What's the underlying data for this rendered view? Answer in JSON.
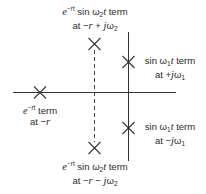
{
  "diagram": {
    "type": "s-plane pole plot",
    "colors": {
      "line": "#333333",
      "text": "#2a2a2a",
      "background": "#ffffff"
    },
    "axes": {
      "horizontal": "real axis",
      "vertical": "imaginary axis"
    },
    "poles": [
      {
        "id": "exp",
        "marker": "x-mark-icon",
        "line1": "term",
        "line1_prefix": "e",
        "line1_exp": "−rt",
        "line2_prefix": "at −",
        "line2_var": "r"
      },
      {
        "id": "damped-upper",
        "marker": "x-mark-icon",
        "line1_prefix": "e",
        "line1_exp": "−rt",
        "line1_mid": " sin ω",
        "line1_sub": "2",
        "line1_t": "t",
        "line1_suffix": " term",
        "line2": "at −r + jω2"
      },
      {
        "id": "damped-lower",
        "marker": "x-mark-icon",
        "line1_prefix": "e",
        "line1_exp": "−rt",
        "line1_mid": " sin ω",
        "line1_sub": "2",
        "line1_t": "t",
        "line1_suffix": " term",
        "line2": "at −r − jω2"
      },
      {
        "id": "sine-upper",
        "marker": "x-mark-icon",
        "line1": "sin ω1t term",
        "line2": "at +jω1"
      },
      {
        "id": "sine-lower",
        "marker": "x-mark-icon",
        "line1": "sin ω1t term",
        "line2": "at −jω1"
      }
    ],
    "labels": {
      "exp": {
        "l1_a": "e",
        "l1_sup": "−rt",
        "l1_b": " term",
        "l2_a": "at −",
        "l2_var": "r"
      },
      "upper_damped": {
        "l1_a": "e",
        "l1_sup": "−rt",
        "l1_b": " sin ω",
        "l1_sub": "2",
        "l1_t": "t",
        "l1_c": " term",
        "l2_a": "at −",
        "l2_r": "r",
        "l2_b": " + ",
        "l2_j": "j",
        "l2_w": "ω",
        "l2_sub": "2"
      },
      "lower_damped": {
        "l1_a": "e",
        "l1_sup": "−rt",
        "l1_b": " sin ω",
        "l1_sub": "2",
        "l1_t": "t",
        "l1_c": " term",
        "l2_a": "at −",
        "l2_r": "r",
        "l2_b": " − ",
        "l2_j": "j",
        "l2_w": "ω",
        "l2_sub": "2"
      },
      "upper_sine": {
        "l1_a": "sin ω",
        "l1_sub": "1",
        "l1_t": "t",
        "l1_c": " term",
        "l2_a": "at +",
        "l2_j": "j",
        "l2_w": "ω",
        "l2_sub": "1"
      },
      "lower_sine": {
        "l1_a": "sin ω",
        "l1_sub": "1",
        "l1_t": "t",
        "l1_c": " term",
        "l2_a": "at −",
        "l2_j": "j",
        "l2_w": "ω",
        "l2_sub": "1"
      }
    }
  }
}
